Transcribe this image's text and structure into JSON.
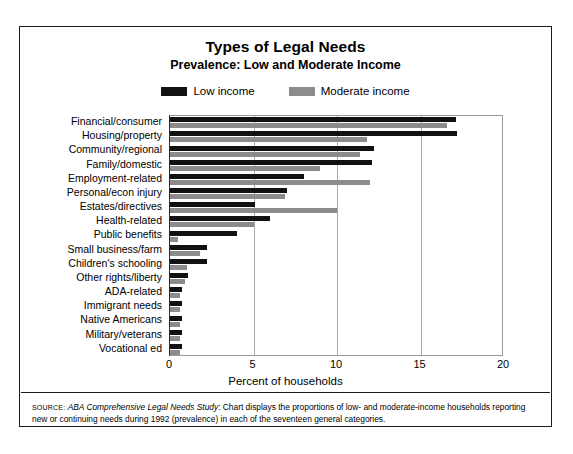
{
  "chart_data": {
    "type": "bar",
    "orientation": "horizontal",
    "title": "Types of Legal Needs",
    "subtitle": "Prevalence: Low and Moderate Income",
    "xlabel": "Percent of households",
    "ylabel": "",
    "xlim": [
      0,
      20
    ],
    "xticks": [
      0,
      5,
      10,
      15,
      20
    ],
    "xtick_labels": [
      "0",
      "5",
      "10",
      "15",
      "20"
    ],
    "grid": true,
    "legend_position": "top-center",
    "categories": [
      "Financial/consumer",
      "Housing/property",
      "Community/regional",
      "Family/domestic",
      "Employment-related",
      "Personal/econ injury",
      "Estates/directives",
      "Health-related",
      "Public benefits",
      "Small business/farm",
      "Children's schooling",
      "Other rights/liberty",
      "ADA-related",
      "Immigrant needs",
      "Native Americans",
      "Military/veterans",
      "Vocational ed"
    ],
    "series": [
      {
        "name": "Low income",
        "color": "#111111",
        "values": [
          17.1,
          17.2,
          12.2,
          12.1,
          8.0,
          7.0,
          5.1,
          6.0,
          4.0,
          2.2,
          2.2,
          1.1,
          0.7,
          0.7,
          0.7,
          0.7,
          0.7
        ]
      },
      {
        "name": "Moderate income",
        "color": "#8c8c8c",
        "values": [
          16.6,
          11.8,
          11.4,
          9.0,
          12.0,
          6.9,
          10.0,
          5.0,
          0.5,
          1.8,
          1.0,
          0.9,
          0.6,
          0.6,
          0.6,
          0.6,
          0.6
        ]
      }
    ]
  },
  "legend": {
    "items": [
      {
        "label": "Low income",
        "color": "#111111"
      },
      {
        "label": "Moderate income",
        "color": "#8c8c8c"
      }
    ]
  },
  "source": {
    "word": "SOURCE:",
    "study": "ABA Comprehensive Legal Needs Study",
    "text": ": Chart displays the proportions of low- and moderate-income households reporting new or continuing needs during 1992 (prevalence) in each of the seventeen general categories."
  }
}
